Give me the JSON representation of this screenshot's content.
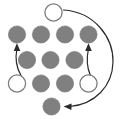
{
  "figure": {
    "canvas": {
      "width": 121,
      "height": 119,
      "background": "#ffffff"
    }
  },
  "colors": {
    "peg_fill": "#808080",
    "peg_stroke": "#6e6e6e",
    "hole_fill": "#ffffff",
    "hole_stroke": "#7a7a7a",
    "arrow": "#2b2b2b"
  },
  "nodes": [
    {
      "id": "n-top-hole",
      "label": "",
      "type": "hole",
      "cx": 53.5,
      "cy": 12.5,
      "r": 8.6
    },
    {
      "id": "n-r1-c1",
      "label": "",
      "type": "peg",
      "cx": 17.0,
      "cy": 34.5,
      "r": 8.6
    },
    {
      "id": "n-r1-c2",
      "label": "",
      "type": "peg",
      "cx": 41.0,
      "cy": 34.5,
      "r": 8.6
    },
    {
      "id": "n-r1-c3",
      "label": "",
      "type": "peg",
      "cx": 65.0,
      "cy": 34.5,
      "r": 8.6
    },
    {
      "id": "n-r1-c4",
      "label": "",
      "type": "peg",
      "cx": 88.5,
      "cy": 34.5,
      "r": 8.6
    },
    {
      "id": "n-r2-c2",
      "label": "",
      "type": "peg",
      "cx": 27.0,
      "cy": 60.0,
      "r": 8.6
    },
    {
      "id": "n-r2-c3",
      "label": "",
      "type": "peg",
      "cx": 50.5,
      "cy": 60.0,
      "r": 8.6
    },
    {
      "id": "n-r2-c4",
      "label": "",
      "type": "peg",
      "cx": 74.5,
      "cy": 60.0,
      "r": 8.6
    },
    {
      "id": "n-r3-c1",
      "label": "",
      "type": "hole",
      "cx": 17.0,
      "cy": 83.5,
      "r": 8.6
    },
    {
      "id": "n-r3-c2",
      "label": "",
      "type": "peg",
      "cx": 41.0,
      "cy": 83.5,
      "r": 8.6
    },
    {
      "id": "n-r3-c3",
      "label": "",
      "type": "peg",
      "cx": 65.0,
      "cy": 83.5,
      "r": 8.6
    },
    {
      "id": "n-r3-c4",
      "label": "",
      "type": "hole",
      "cx": 88.5,
      "cy": 83.5,
      "r": 8.6
    },
    {
      "id": "n-bottom-peg",
      "label": "",
      "type": "peg",
      "cx": 51.5,
      "cy": 106.5,
      "r": 8.6
    }
  ],
  "arrows": [
    {
      "id": "arrow-left-up",
      "label": "",
      "from": "n-r3-c1",
      "to": "n-r1-c1",
      "path": "M 21.0 75.5 C 15.5 66.0 15.0 58.0 17.0 48.5",
      "head": "16.9,43.2 13.7,51.0 20.3,51.0"
    },
    {
      "id": "arrow-right-up",
      "label": "",
      "from": "n-r3-c4",
      "to": "n-r1-c4",
      "path": "M 90.5 75.5 C 86.0 66.0 86.5 58.0 88.5 48.5",
      "head": "88.4,43.2 85.2,51.0 91.8,51.0"
    },
    {
      "id": "arrow-outer-loop",
      "label": "",
      "from": "n-top-hole",
      "to": "n-bottom-peg",
      "path": "M 63.5 10.0 C 95.0 12.0 113.5 38.0 113.0 62.0 C 112.5 86.0 95.0 104.5 69.5 106.5",
      "head": "63.6,106.6 71.6,103.5 71.4,110.1"
    }
  ]
}
